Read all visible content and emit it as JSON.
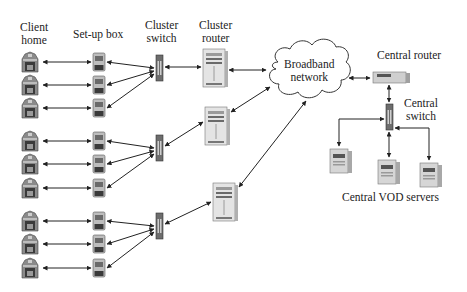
{
  "labels": {
    "client_home": [
      "Client",
      "home"
    ],
    "set_up_box": "Set-up box",
    "cluster_switch": [
      "Cluster",
      "switch"
    ],
    "cluster_router": [
      "Cluster",
      "router"
    ],
    "broadband_network": [
      "Broadband",
      "network"
    ],
    "central_router": "Central router",
    "central_switch": [
      "Central",
      "switch"
    ],
    "central_vod_servers": "Central VOD servers"
  },
  "clusters": [
    {
      "homes": 3,
      "set_up_boxes": 3,
      "switch": 1,
      "router": 1
    },
    {
      "homes": 3,
      "set_up_boxes": 3,
      "switch": 1,
      "router": 1
    },
    {
      "homes": 3,
      "set_up_boxes": 3,
      "switch": 1,
      "router": 1
    }
  ],
  "central": {
    "router": 1,
    "switch": 1,
    "vod_servers": 3
  },
  "colors": {
    "line": "#222222",
    "device_light": "#d8d8d8",
    "device_dark": "#555555",
    "text": "#222222"
  }
}
